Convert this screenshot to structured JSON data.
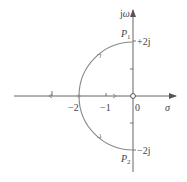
{
  "diagram": {
    "type": "root-locus",
    "axes": {
      "imag_label_j": "j",
      "imag_label_omega": "ω",
      "real_label": "σ",
      "origin_label": "0"
    },
    "ticks": {
      "real": [
        {
          "value": -2,
          "label": "−2"
        },
        {
          "value": -1,
          "label": "−1"
        }
      ],
      "imag": [
        {
          "value": 2,
          "label": "+2j"
        },
        {
          "value": -2,
          "label": "−2j"
        }
      ]
    },
    "poles": [
      {
        "name": "P1",
        "label_main": "P",
        "label_sub": "1",
        "re": 0,
        "im": 2
      },
      {
        "name": "P2",
        "label_main": "P",
        "label_sub": "2",
        "re": 0,
        "im": -2
      }
    ],
    "zeros": [
      {
        "re": 0,
        "im": 0
      }
    ],
    "locus": {
      "shape": "semicircle",
      "center": [
        0,
        0
      ],
      "radius": 2,
      "breakaway_point": -2
    },
    "colors": {
      "axis": "#555555",
      "locus": "#888888",
      "text": "#444444"
    }
  }
}
